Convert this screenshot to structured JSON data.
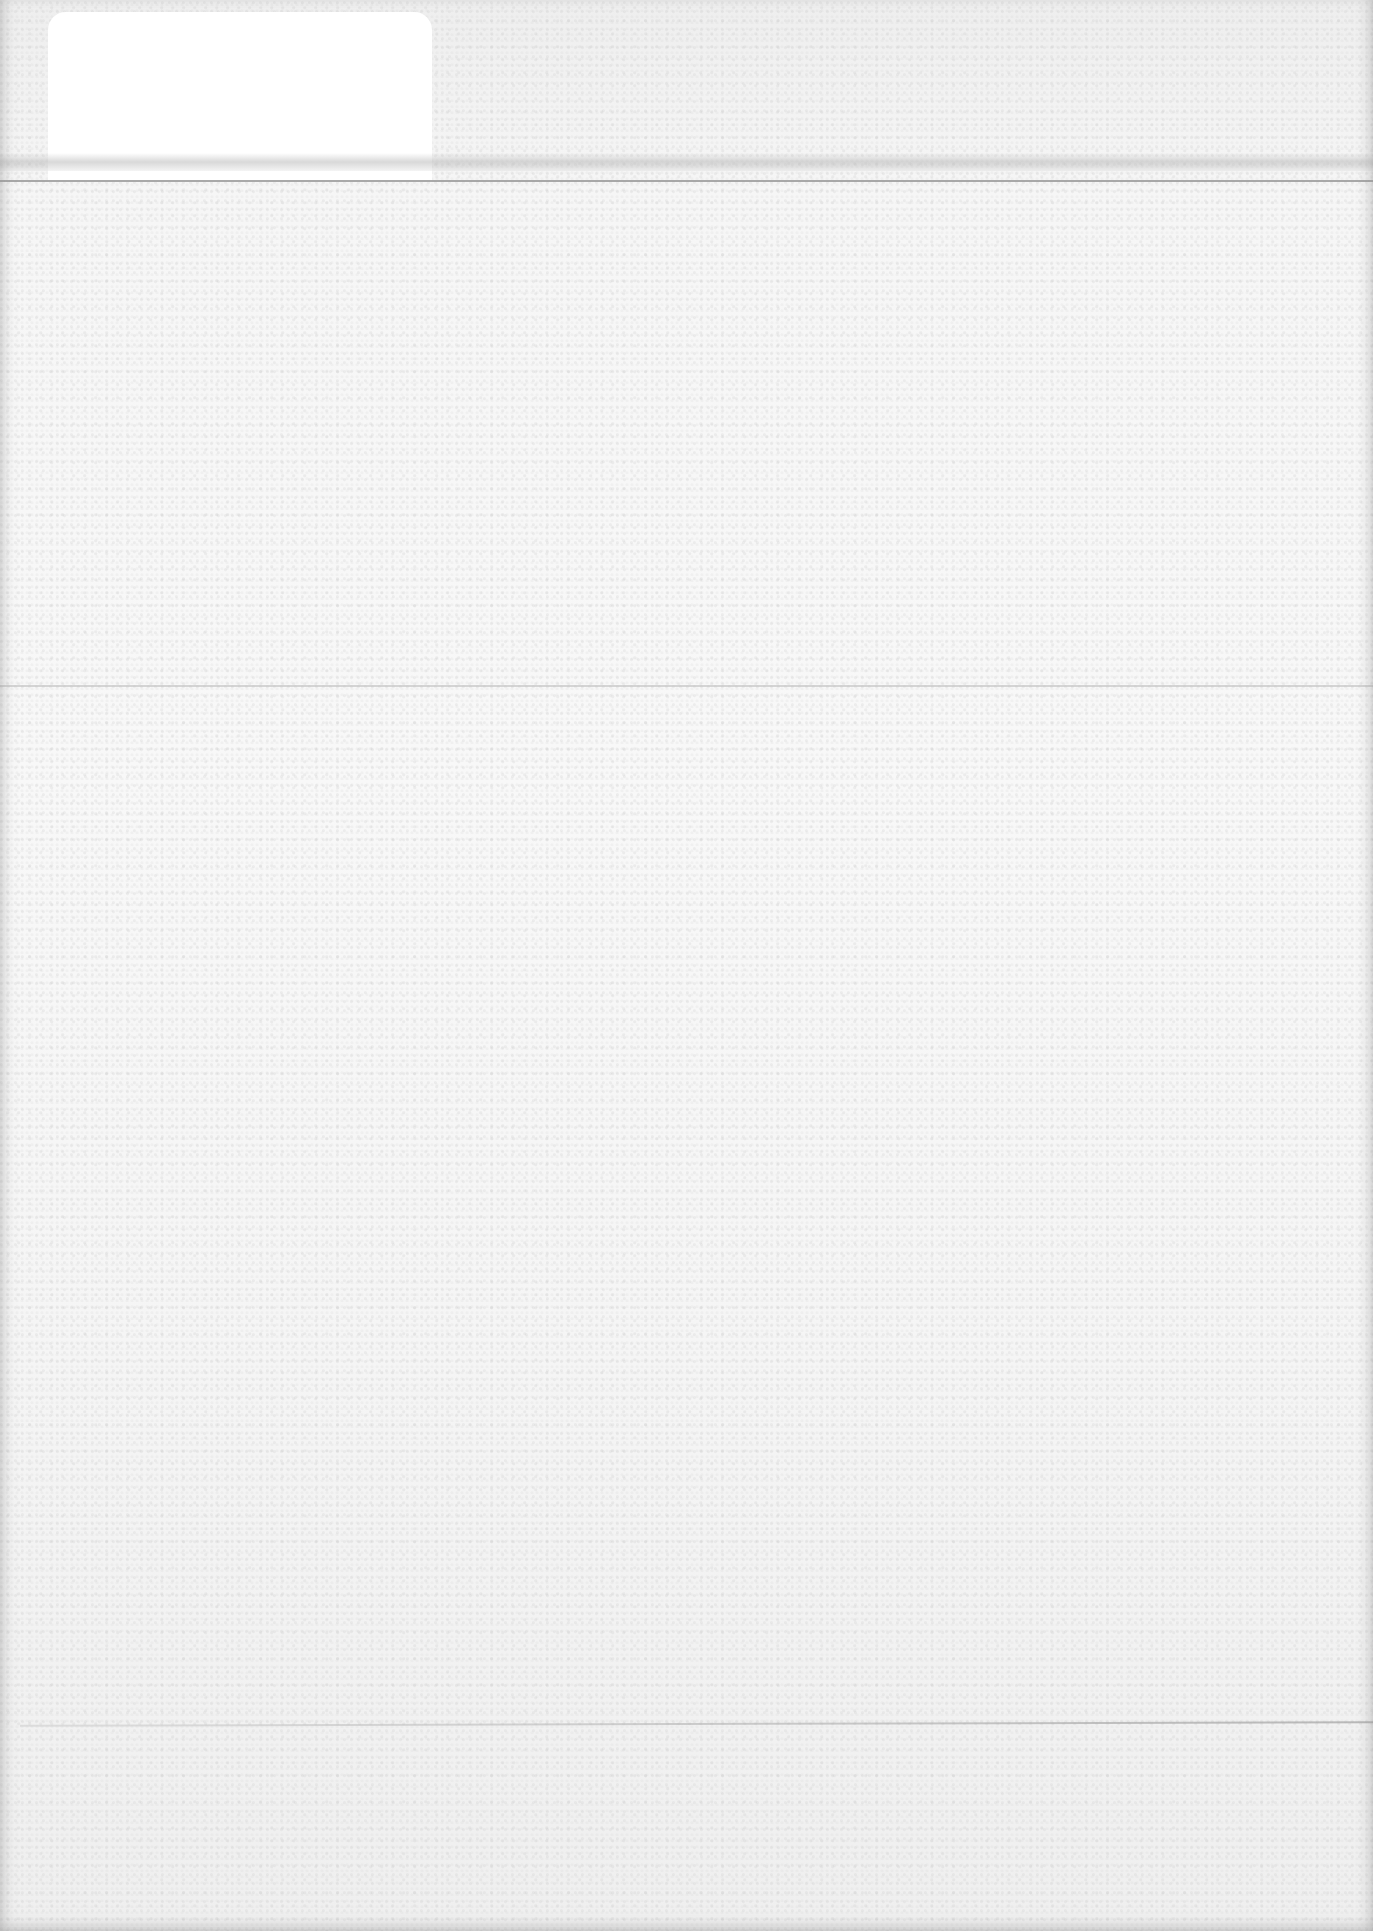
{
  "page": {
    "type": "blank scanned page",
    "background_color": "#f3f3f3",
    "text": ""
  },
  "elements": {
    "label_patch": {
      "color": "#ffffff"
    },
    "header_rule": {
      "color": "#9a9a9a"
    },
    "fold_line": {
      "color": "#c4c4c4"
    },
    "bottom_line": {
      "color": "#b0b0b0"
    }
  }
}
